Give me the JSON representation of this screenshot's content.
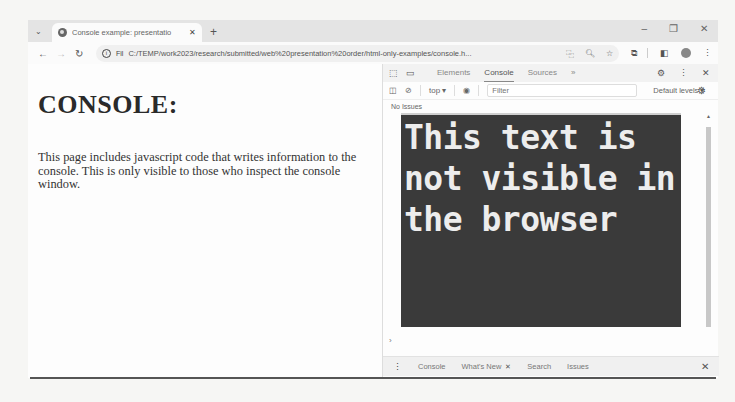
{
  "browser": {
    "tab": {
      "title": "Console example: presentatio",
      "favicon": "globe-icon",
      "close_glyph": "✕"
    },
    "new_tab_glyph": "+",
    "tab_search_glyph": "⌄",
    "window_controls": {
      "minimize": "–",
      "restore": "❐",
      "close": "✕"
    },
    "toolbar": {
      "back": "←",
      "forward": "→",
      "reload": "↻",
      "info_glyph": "i",
      "file_label": "Fil",
      "url": "C:/TEMP/work2023/research/submitted/web%20presentation%20order/html-only-examples/console.h...",
      "translate_glyph": "⿻",
      "zoom_glyph": "🔍︎",
      "bookmark_glyph": "☆",
      "extensions_glyph": "⧉",
      "sidepanel_glyph": "◧",
      "menu_glyph": "⋮"
    }
  },
  "page": {
    "heading": "CONSOLE:",
    "paragraph": "This page includes javascript code that writes information to the console. This is only visible to those who inspect the console window."
  },
  "devtools": {
    "top_icons": {
      "inspect": "⬚",
      "device": "▭"
    },
    "tabs": [
      {
        "label": "Elements",
        "active": false
      },
      {
        "label": "Console",
        "active": true
      },
      {
        "label": "Sources",
        "active": false
      }
    ],
    "more_tabs": "»",
    "settings_glyph": "⚙",
    "kebab_glyph": "⋮",
    "close_glyph": "✕",
    "console_bar": {
      "sidebar_glyph": "◫",
      "clear_glyph": "⊘",
      "context": "top ▾",
      "eye_glyph": "◉",
      "filter_placeholder": "Filter",
      "levels": "Default levels ▾",
      "settings_glyph": "⚙"
    },
    "issues": "No Issues",
    "console_message": "This text is not visible in the browser",
    "prompt": "›",
    "drawer": {
      "kebab": "⋮",
      "tabs": [
        "Console",
        "What's New",
        "Search",
        "Issues"
      ],
      "whats_new_close": "✕",
      "close_glyph": "✕"
    }
  }
}
